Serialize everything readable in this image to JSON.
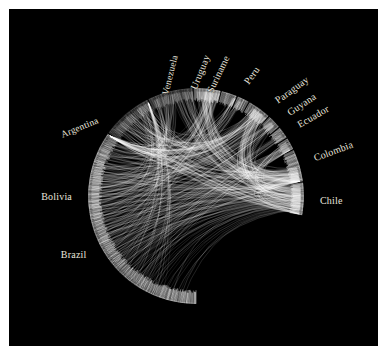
{
  "figure": {
    "background_color": "#ffffff",
    "plot_background_color": "#000000",
    "label_color": "#e8e4dc",
    "link_color": "#ffffff",
    "title": ""
  },
  "chart_data": {
    "type": "chord",
    "title": "",
    "subtitle": "",
    "xlabel": "",
    "ylabel": "",
    "grid": false,
    "legend_position": "none",
    "center": [
      196,
      196
    ],
    "radius": 108,
    "nodes": [
      {
        "label": "Brazil",
        "start_angle": 90,
        "end_angle": 215,
        "label_angle": 152,
        "label_rotation": 0,
        "radius_frac": 1.0
      },
      {
        "label": "Bolivia",
        "start_angle": 216,
        "end_angle": 243,
        "label_angle": 180,
        "label_rotation": 0,
        "radius_frac": 1.0
      },
      {
        "label": "Argentina",
        "start_angle": 244,
        "end_angle": 268,
        "label_angle": 218,
        "label_rotation": -22,
        "radius_frac": 1.0
      },
      {
        "label": "Venezuela",
        "start_angle": 269,
        "end_angle": 283,
        "label_angle": 258,
        "label_rotation": -76,
        "radius_frac": 1.0
      },
      {
        "label": "Uruguay",
        "start_angle": 284,
        "end_angle": 292,
        "label_angle": 272,
        "label_rotation": -68,
        "radius_frac": 1.0
      },
      {
        "label": "Suriname",
        "start_angle": 293,
        "end_angle": 299,
        "label_angle": 280,
        "label_rotation": -64,
        "radius_frac": 1.0
      },
      {
        "label": "Peru",
        "start_angle": 300,
        "end_angle": 312,
        "label_angle": 294,
        "label_rotation": -54,
        "radius_frac": 1.0
      },
      {
        "label": "Paraguay",
        "start_angle": 313,
        "end_angle": 320,
        "label_angle": 310,
        "label_rotation": -36,
        "radius_frac": 1.0
      },
      {
        "label": "Guyana",
        "start_angle": 321,
        "end_angle": 327,
        "label_angle": 318,
        "label_rotation": -33,
        "radius_frac": 1.0
      },
      {
        "label": "Ecuador",
        "start_angle": 328,
        "end_angle": 334,
        "label_angle": 325,
        "label_rotation": -30,
        "radius_frac": 1.0
      },
      {
        "label": "Colombia",
        "start_angle": 335,
        "end_angle": 352,
        "label_angle": 342,
        "label_rotation": -20,
        "radius_frac": 1.0
      },
      {
        "label": "Chile",
        "start_angle": 353,
        "end_angle": 10,
        "label_angle": 2,
        "label_rotation": 0,
        "radius_frac": 1.0
      }
    ],
    "labels": [
      "Brazil",
      "Bolivia",
      "Argentina",
      "Venezuela",
      "Uruguay",
      "Suriname",
      "Peru",
      "Paraguay",
      "Guyana",
      "Ecuador",
      "Colombia",
      "Chile"
    ],
    "values": [
      125,
      27,
      24,
      14,
      8,
      6,
      12,
      7,
      6,
      6,
      17,
      17
    ],
    "links": [
      {
        "source": "Brazil",
        "target": "Chile",
        "weight": 46
      },
      {
        "source": "Brazil",
        "target": "Colombia",
        "weight": 38
      },
      {
        "source": "Brazil",
        "target": "Peru",
        "weight": 34
      },
      {
        "source": "Brazil",
        "target": "Bolivia",
        "weight": 30
      },
      {
        "source": "Brazil",
        "target": "Venezuela",
        "weight": 26
      },
      {
        "source": "Brazil",
        "target": "Argentina",
        "weight": 22
      },
      {
        "source": "Brazil",
        "target": "Ecuador",
        "weight": 18
      },
      {
        "source": "Brazil",
        "target": "Paraguay",
        "weight": 15
      },
      {
        "source": "Brazil",
        "target": "Uruguay",
        "weight": 12
      },
      {
        "source": "Brazil",
        "target": "Guyana",
        "weight": 10
      },
      {
        "source": "Brazil",
        "target": "Suriname",
        "weight": 8
      },
      {
        "source": "Bolivia",
        "target": "Chile",
        "weight": 20
      },
      {
        "source": "Bolivia",
        "target": "Peru",
        "weight": 16
      },
      {
        "source": "Bolivia",
        "target": "Colombia",
        "weight": 12
      },
      {
        "source": "Bolivia",
        "target": "Venezuela",
        "weight": 9
      },
      {
        "source": "Argentina",
        "target": "Chile",
        "weight": 14
      },
      {
        "source": "Argentina",
        "target": "Colombia",
        "weight": 8
      },
      {
        "source": "Peru",
        "target": "Chile",
        "weight": 18
      },
      {
        "source": "Peru",
        "target": "Colombia",
        "weight": 14
      },
      {
        "source": "Venezuela",
        "target": "Colombia",
        "weight": 16
      },
      {
        "source": "Venezuela",
        "target": "Chile",
        "weight": 11
      },
      {
        "source": "Colombia",
        "target": "Chile",
        "weight": 13
      },
      {
        "source": "Ecuador",
        "target": "Chile",
        "weight": 9
      },
      {
        "source": "Paraguay",
        "target": "Chile",
        "weight": 7
      }
    ]
  }
}
